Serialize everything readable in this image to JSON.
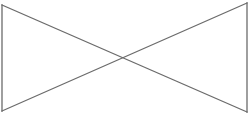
{
  "diagram": {
    "type": "bowtie",
    "background": "#ffffff",
    "stroke_color": "#6b6b6b",
    "stroke_width": 1.3,
    "vertices": {
      "top_left": [
        2,
        5
      ],
      "bottom_left": [
        2,
        111
      ],
      "top_right": [
        247,
        3
      ],
      "bottom_right": [
        247,
        112
      ]
    },
    "crossing_point": [
      124,
      58
    ],
    "segments": [
      {
        "name": "left-edge",
        "from": "top_left",
        "to": "bottom_left"
      },
      {
        "name": "right-edge",
        "from": "top_right",
        "to": "bottom_right"
      },
      {
        "name": "diagonal-down",
        "from": "top_left",
        "to": "bottom_right"
      },
      {
        "name": "diagonal-up",
        "from": "bottom_left",
        "to": "top_right"
      }
    ]
  }
}
